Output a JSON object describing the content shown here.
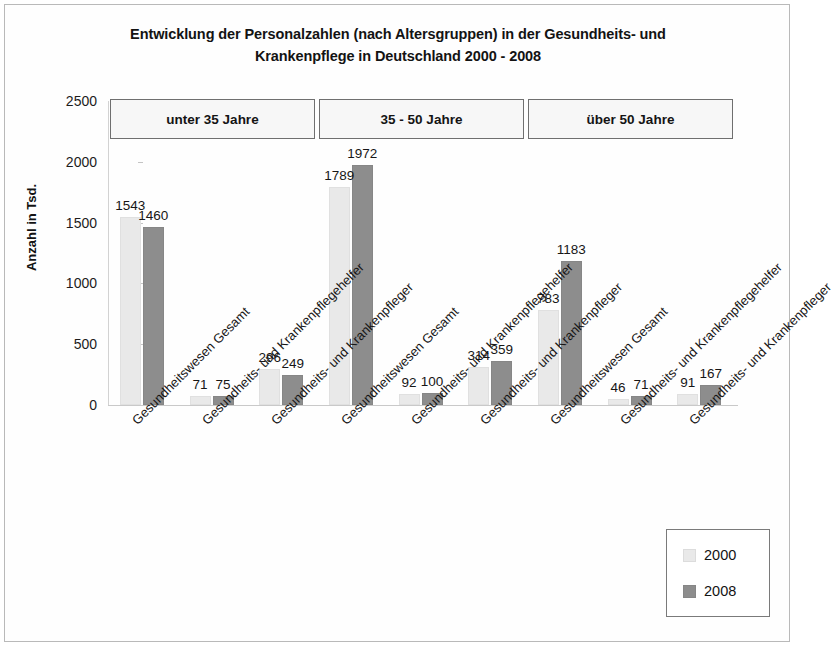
{
  "chart_data": {
    "type": "bar",
    "title": "Entwicklung der Personalzahlen (nach Altersgruppen) in der Gesundheits- und Krankenpflege in  Deutschland 2000 - 2008",
    "title_line1": "Entwicklung der Personalzahlen (nach Altersgruppen) in der Gesundheits- und",
    "title_line2": "Krankenpflege in  Deutschland 2000 - 2008",
    "xlabel": "",
    "ylabel": "Anzahl in Tsd.",
    "ylim": [
      0,
      2500
    ],
    "ytick_labels": [
      "2500",
      "2000",
      "1500",
      "1000",
      "500",
      "0"
    ],
    "ytick_values": [
      2500,
      2000,
      1500,
      1000,
      500,
      0
    ],
    "grid": false,
    "legend_position": "bottom-right",
    "categories": [
      "Gesundheitswesen Gesamt",
      "Gesundheits- und Krankenpflegehelfer",
      "Gesundheits- und Krankenpfleger",
      "Gesundheitswesen Gesamt",
      "Gesundheits- und Krankenpflegehelfer",
      "Gesundheits- und Krankenpfleger",
      "Gesundheitswesen Gesamt",
      "Gesundheits- und Krankenpflegehelfer",
      "Gesundheits- und Krankenpfleger"
    ],
    "series": [
      {
        "name": "2000",
        "color": "#e9e9e9",
        "values": [
          1543,
          71,
          296,
          1789,
          92,
          314,
          783,
          46,
          91
        ]
      },
      {
        "name": "2008",
        "color": "#8d8d8d",
        "values": [
          1460,
          75,
          249,
          1972,
          100,
          359,
          1183,
          71,
          167
        ]
      }
    ],
    "age_groups": [
      {
        "label": "unter 35 Jahre",
        "categories": [
          0,
          1,
          2
        ]
      },
      {
        "label": "35 - 50 Jahre",
        "categories": [
          3,
          4,
          5
        ]
      },
      {
        "label": "über 50 Jahre",
        "categories": [
          6,
          7,
          8
        ]
      }
    ]
  },
  "legend": {
    "entries": [
      {
        "label": "2000",
        "color": "#e9e9e9"
      },
      {
        "label": "2008",
        "color": "#8d8d8d"
      }
    ]
  }
}
